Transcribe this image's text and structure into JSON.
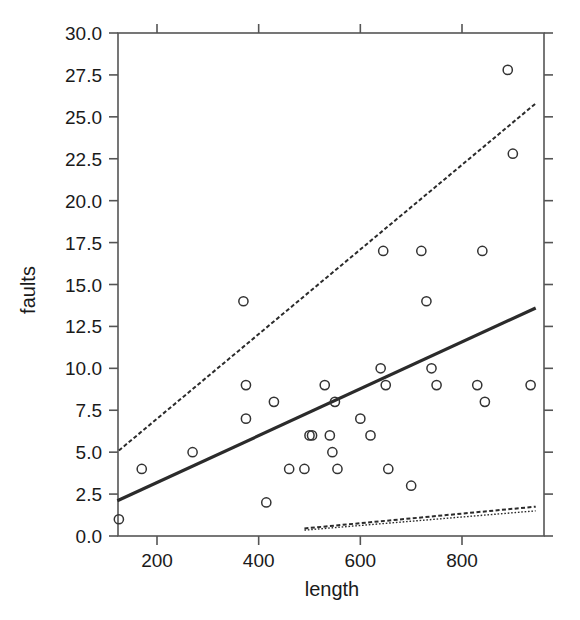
{
  "chart_data": {
    "type": "scatter",
    "title": "",
    "xlabel": "length",
    "ylabel": "faults",
    "xlim": [
      118,
      950
    ],
    "ylim": [
      0,
      30
    ],
    "grid": false,
    "legend": "none",
    "x_ticks": [
      200,
      400,
      600,
      800
    ],
    "x_tick_labels": [
      "200",
      "400",
      "600",
      "800"
    ],
    "y_ticks": [
      0.0,
      2.5,
      5.0,
      7.5,
      10.0,
      12.5,
      15.0,
      17.5,
      20.0,
      22.5,
      25.0,
      27.5,
      30.0
    ],
    "y_tick_labels": [
      "0.0",
      "2.5",
      "5.0",
      "7.5",
      "10.0",
      "12.5",
      "15.0",
      "17.5",
      "20.0",
      "22.5",
      "25.0",
      "27.5",
      "30.0"
    ],
    "marker": "open-circle",
    "marker_color": "#333333",
    "points": [
      {
        "x": 125,
        "y": 1
      },
      {
        "x": 170,
        "y": 4
      },
      {
        "x": 270,
        "y": 5
      },
      {
        "x": 370,
        "y": 14
      },
      {
        "x": 375,
        "y": 9
      },
      {
        "x": 375,
        "y": 7
      },
      {
        "x": 415,
        "y": 2
      },
      {
        "x": 430,
        "y": 8
      },
      {
        "x": 460,
        "y": 4
      },
      {
        "x": 490,
        "y": 4
      },
      {
        "x": 500,
        "y": 6
      },
      {
        "x": 505,
        "y": 6
      },
      {
        "x": 530,
        "y": 9
      },
      {
        "x": 540,
        "y": 6
      },
      {
        "x": 545,
        "y": 5
      },
      {
        "x": 550,
        "y": 8
      },
      {
        "x": 555,
        "y": 4
      },
      {
        "x": 600,
        "y": 7
      },
      {
        "x": 620,
        "y": 6
      },
      {
        "x": 640,
        "y": 10
      },
      {
        "x": 645,
        "y": 17
      },
      {
        "x": 650,
        "y": 9
      },
      {
        "x": 655,
        "y": 4
      },
      {
        "x": 700,
        "y": 3
      },
      {
        "x": 720,
        "y": 17
      },
      {
        "x": 730,
        "y": 14
      },
      {
        "x": 740,
        "y": 10
      },
      {
        "x": 750,
        "y": 9
      },
      {
        "x": 830,
        "y": 9
      },
      {
        "x": 840,
        "y": 17
      },
      {
        "x": 845,
        "y": 8
      },
      {
        "x": 890,
        "y": 27.8
      },
      {
        "x": 900,
        "y": 22.8
      },
      {
        "x": 935,
        "y": 9
      }
    ],
    "series": [
      {
        "name": "solid-fit",
        "style": "solid",
        "x": [
          122,
          945
        ],
        "y": [
          2.1,
          13.6
        ]
      },
      {
        "name": "dashed-upper-fit",
        "style": "dashed",
        "x": [
          125,
          945
        ],
        "y": [
          5.1,
          25.8
        ]
      },
      {
        "name": "dashed-lower-fit-a",
        "style": "dashed",
        "x": [
          490,
          945
        ],
        "y": [
          0.45,
          1.75
        ]
      },
      {
        "name": "dashed-lower-fit-b",
        "style": "dotted",
        "x": [
          490,
          945
        ],
        "y": [
          0.35,
          1.5
        ]
      }
    ]
  },
  "axes": {
    "x_label": "length",
    "y_label": "faults"
  }
}
